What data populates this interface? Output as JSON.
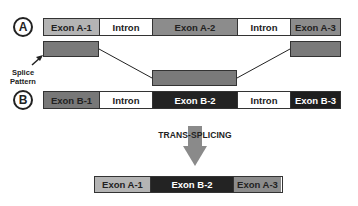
{
  "diagram": {
    "row_a": {
      "label": "A",
      "segments": [
        {
          "text": "Exon A-1",
          "type": "exon",
          "color": "#b4b4b4",
          "text_color": "#222222"
        },
        {
          "text": "Intron",
          "type": "intron",
          "color": "#ffffff",
          "text_color": "#222222"
        },
        {
          "text": "Exon A-2",
          "type": "exon",
          "color": "#8c8c8c",
          "text_color": "#222222"
        },
        {
          "text": "Intron",
          "type": "intron",
          "color": "#ffffff",
          "text_color": "#222222"
        },
        {
          "text": "Exon A-3",
          "type": "exon",
          "color": "#8c8c8c",
          "text_color": "#222222"
        }
      ]
    },
    "splice_pattern": {
      "label_line1": "Splice",
      "label_line2": "Pattern",
      "box_color": "#7a7a7a"
    },
    "row_b": {
      "label": "B",
      "segments": [
        {
          "text": "Exon B-1",
          "type": "exon",
          "color": "#787878",
          "text_color": "#222222"
        },
        {
          "text": "Intron",
          "type": "intron",
          "color": "#ffffff",
          "text_color": "#222222"
        },
        {
          "text": "Exon B-2",
          "type": "exon",
          "color": "#232323",
          "text_color": "#ffffff"
        },
        {
          "text": "Intron",
          "type": "intron",
          "color": "#ffffff",
          "text_color": "#222222"
        },
        {
          "text": "Exon B-3",
          "type": "exon",
          "color": "#1e1e1e",
          "text_color": "#ffffff"
        }
      ]
    },
    "process": {
      "label": "TRANS-SPLICING",
      "arrow_color": "#8a8a8a"
    },
    "result": {
      "segments": [
        {
          "text": "Exon A-1",
          "color": "#b4b4b4",
          "text_color": "#222222"
        },
        {
          "text": "Exon B-2",
          "color": "#232323",
          "text_color": "#ffffff"
        },
        {
          "text": "Exon A-3",
          "color": "#8c8c8c",
          "text_color": "#222222"
        }
      ]
    }
  }
}
